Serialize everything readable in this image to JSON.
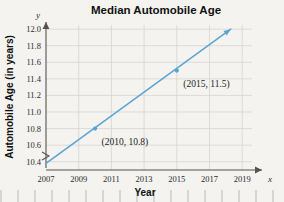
{
  "chart_data": {
    "type": "line",
    "title": "Median Automobile Age",
    "xlabel": "Year",
    "ylabel": "Automobile Age (in years)",
    "x_axis_letter": "x",
    "y_axis_letter": "y",
    "xlim": [
      2007,
      2019.6
    ],
    "ylim": [
      10.3,
      12.05
    ],
    "y_axis_break": true,
    "grid": true,
    "legend": "none",
    "xticks": [
      "2007",
      "2009",
      "2011",
      "2013",
      "2015",
      "2017",
      "2019"
    ],
    "xtick_values": [
      2007,
      2009,
      2011,
      2013,
      2015,
      2017,
      2019
    ],
    "yticks": [
      "10.4",
      "10.6",
      "10.8",
      "11.0",
      "11.2",
      "11.4",
      "11.6",
      "11.8",
      "12.0"
    ],
    "ytick_values": [
      10.4,
      10.6,
      10.8,
      11.0,
      11.2,
      11.4,
      11.6,
      11.8,
      12.0
    ],
    "series": [
      {
        "name": "Median automobile age",
        "color": "#58a5d2",
        "x": [
          2007,
          2018.3
        ],
        "values": [
          10.38,
          12.0
        ],
        "arrow_end": true
      }
    ],
    "points": [
      {
        "x": 2010,
        "y": 10.8,
        "label": "(2010, 10.8)"
      },
      {
        "x": 2015,
        "y": 11.5,
        "label": "(2015, 11.5)"
      }
    ],
    "annotations": [
      {
        "text": "(2010, 10.8)",
        "x": 2010.4,
        "y": 10.72
      },
      {
        "text": "(2015, 11.5)",
        "x": 2015.4,
        "y": 11.42
      }
    ],
    "colors": {
      "line": "#58a5d2",
      "grid": "#d2d0cc",
      "axis": "#55534f",
      "background": "#f4f3f0"
    }
  }
}
